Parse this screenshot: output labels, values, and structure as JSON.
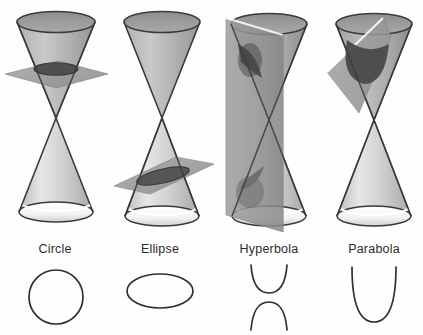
{
  "figure": {
    "background_color": "#fefefe",
    "outline_color": "#3a3a3a",
    "curve_color": "#2f2f2f",
    "label_color": "#2b2b2b",
    "cone_light": "#efefef",
    "cone_mid": "#b9b9b9",
    "cone_dark": "#8e8e8e",
    "plane_color": "#9a9a9a",
    "plane_dark": "#6f6f6f",
    "intersection_dark": "#5a5a5a",
    "rim_highlight": "#ffffff"
  },
  "panels": [
    {
      "id": "circle",
      "label": "Circle",
      "label_x": 55,
      "label_y": 253,
      "curve_type": "circle",
      "plane_orientation": "horizontal",
      "description": "Plane cuts the upper nappe perpendicular to the axis"
    },
    {
      "id": "ellipse",
      "label": "Ellipse",
      "label_x": 160,
      "label_y": 253,
      "curve_type": "ellipse",
      "plane_orientation": "oblique",
      "description": "Plane cuts the lower nappe at an angle less than the side slope"
    },
    {
      "id": "hyperbola",
      "label": "Hyperbola",
      "label_x": 269,
      "label_y": 253,
      "curve_type": "hyperbola",
      "plane_orientation": "vertical",
      "description": "Plane cuts both nappes parallel to the axis"
    },
    {
      "id": "parabola",
      "label": "Parabola",
      "label_x": 374,
      "label_y": 253,
      "curve_type": "parabola",
      "plane_orientation": "parallel-to-side",
      "description": "Plane cuts one nappe parallel to a generating line"
    }
  ]
}
